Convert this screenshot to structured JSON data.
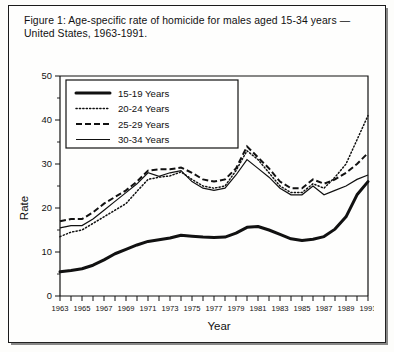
{
  "figure": {
    "caption_line1": "Figure 1: Age-specific rate of homicide for males aged 15-34 years —",
    "caption_line2": "United States, 1963-1991."
  },
  "chart_data": {
    "type": "line",
    "title": "Figure 1: Age-specific rate of homicide for males aged 15-34 years — United States, 1963-1991.",
    "xlabel": "Year",
    "ylabel": "Rate",
    "xlim": [
      1963,
      1991
    ],
    "ylim": [
      0,
      50
    ],
    "yticks": [
      0,
      10,
      20,
      30,
      40,
      50
    ],
    "xticks": [
      1963,
      1964,
      1965,
      1966,
      1967,
      1968,
      1969,
      1970,
      1971,
      1972,
      1973,
      1974,
      1975,
      1976,
      1977,
      1978,
      1979,
      1980,
      1981,
      1982,
      1983,
      1984,
      1985,
      1986,
      1987,
      1988,
      1989,
      1990,
      1991
    ],
    "xticklabels": [
      1963,
      1965,
      1967,
      1969,
      1971,
      1973,
      1975,
      1977,
      1979,
      1981,
      1983,
      1985,
      1987,
      1989,
      1991
    ],
    "grid": false,
    "legend_position": "upper left",
    "x": [
      1963,
      1964,
      1965,
      1966,
      1967,
      1968,
      1969,
      1970,
      1971,
      1972,
      1973,
      1974,
      1975,
      1976,
      1977,
      1978,
      1979,
      1980,
      1981,
      1982,
      1983,
      1984,
      1985,
      1986,
      1987,
      1988,
      1989,
      1990,
      1991
    ],
    "series": [
      {
        "name": "15-19 Years",
        "style": "solid-thick",
        "values": [
          5.5,
          5.8,
          6.2,
          7.0,
          8.2,
          9.6,
          10.6,
          11.6,
          12.4,
          12.8,
          13.2,
          13.8,
          13.6,
          13.4,
          13.3,
          13.4,
          14.3,
          15.6,
          15.8,
          15.0,
          14.0,
          13.0,
          12.6,
          12.9,
          13.5,
          15.2,
          18.0,
          23.0,
          26.0
        ]
      },
      {
        "name": "20-24 Years",
        "style": "dotted",
        "values": [
          13.5,
          14.5,
          15.0,
          16.5,
          18.0,
          19.5,
          21.0,
          23.8,
          26.5,
          27.0,
          27.3,
          28.2,
          26.5,
          25.0,
          24.5,
          25.0,
          28.5,
          33.0,
          31.0,
          28.0,
          25.0,
          23.5,
          23.5,
          25.5,
          24.5,
          27.0,
          30.0,
          35.5,
          41.0
        ]
      },
      {
        "name": "25-29 Years",
        "style": "dashed",
        "values": [
          17.0,
          17.5,
          17.5,
          19.0,
          21.0,
          22.5,
          24.0,
          26.0,
          28.5,
          28.8,
          28.8,
          29.2,
          28.0,
          26.5,
          26.0,
          26.5,
          29.0,
          34.0,
          31.5,
          29.0,
          26.0,
          24.5,
          24.5,
          26.5,
          25.5,
          26.5,
          28.0,
          30.0,
          32.5
        ]
      },
      {
        "name": "30-34 Years",
        "style": "solid-thin",
        "values": [
          15.5,
          16.0,
          16.0,
          17.5,
          19.5,
          21.5,
          23.5,
          25.5,
          28.0,
          27.2,
          28.0,
          28.5,
          26.0,
          24.5,
          24.0,
          24.5,
          27.5,
          31.0,
          29.0,
          27.0,
          24.5,
          23.0,
          23.0,
          25.0,
          23.0,
          24.0,
          25.0,
          26.5,
          27.5
        ]
      }
    ]
  },
  "legend": {
    "items": [
      {
        "label": "15-19 Years",
        "style": "solid-thick"
      },
      {
        "label": "20-24 Years",
        "style": "dotted"
      },
      {
        "label": "25-29 Years",
        "style": "dashed"
      },
      {
        "label": "30-34 Years",
        "style": "solid-thin"
      }
    ]
  },
  "axes": {
    "y_title": "Rate",
    "x_title": "Year"
  }
}
